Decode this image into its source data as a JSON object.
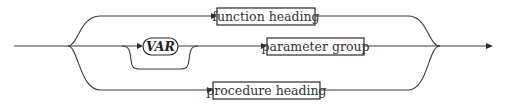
{
  "diagram": {
    "type": "syntax-diagram",
    "nodes": {
      "function_heading": {
        "label": "function heading",
        "kind": "nonterminal"
      },
      "var_keyword": {
        "label": "VAR",
        "kind": "terminal",
        "optional": true
      },
      "parameter_group": {
        "label": "parameter group",
        "kind": "nonterminal"
      },
      "procedure_heading": {
        "label": "procedure heading",
        "kind": "nonterminal"
      }
    },
    "branches": [
      {
        "path": [
          "function heading"
        ]
      },
      {
        "path": [
          "VAR (optional)",
          "parameter group"
        ]
      },
      {
        "path": [
          "procedure heading"
        ]
      }
    ],
    "colors": {
      "line": "#3a3a3a",
      "box_border": "#2a2a2a",
      "text": "#333333"
    }
  }
}
